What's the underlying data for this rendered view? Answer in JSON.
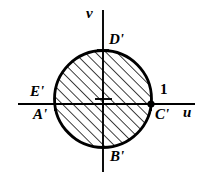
{
  "figure": {
    "type": "complex-plane-diagram",
    "background_color": "#ffffff",
    "stroke_color": "#000000",
    "hatch_color": "#000000",
    "axes": {
      "horizontal": {
        "name": "u-axis",
        "label": "u",
        "y": 104,
        "x_start": 18,
        "x_end": 195
      },
      "vertical": {
        "name": "v-axis",
        "label": "v",
        "x": 103,
        "y_start": 10,
        "y_end": 172
      }
    },
    "circle": {
      "name": "unit-circle",
      "center_x": 103,
      "center_y": 99,
      "radius": 49,
      "stroke_width": 2.6,
      "hatched": true,
      "hatch_angle_deg": 45,
      "hatch_spacing": 7.5
    },
    "origin_marker": {
      "name": "origin-cross",
      "x": 103,
      "y": 99,
      "size": 11
    },
    "markers": [
      {
        "name": "top-intersection-cross",
        "x": 103,
        "y": 50,
        "size": 9,
        "dot": false
      },
      {
        "name": "bottom-intersection-cross",
        "x": 103,
        "y": 148,
        "size": 9,
        "dot": false
      },
      {
        "name": "left-intersection-cross",
        "x": 55,
        "y": 104,
        "size": 9,
        "dot": false
      },
      {
        "name": "right-intersection-dot",
        "x": 152,
        "y": 104,
        "size": 10,
        "dot": true
      }
    ],
    "labels": {
      "v_axis": "v",
      "u_axis": "u",
      "point_D": "D'",
      "point_B": "B'",
      "point_E": "E'",
      "point_A": "A'",
      "point_C": "C'",
      "unit_value": "1"
    }
  }
}
